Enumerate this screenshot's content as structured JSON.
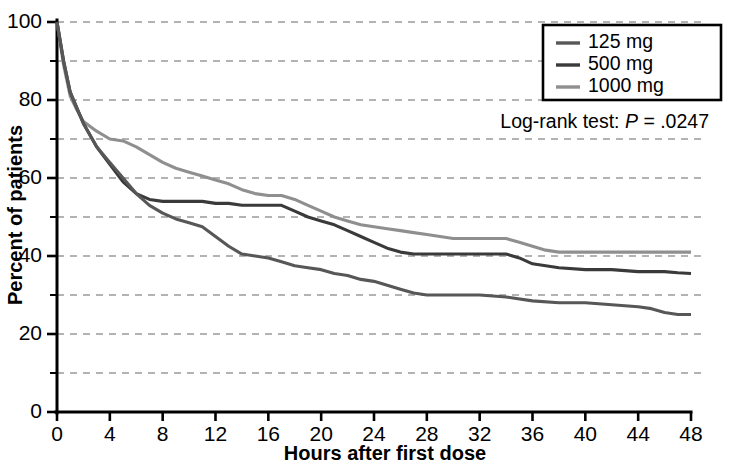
{
  "chart_data": {
    "type": "line",
    "title": "",
    "subtitle": "",
    "xlabel": "Hours after first dose",
    "ylabel": "Percent of patients",
    "xlim": [
      0,
      48
    ],
    "ylim": [
      0,
      100
    ],
    "xticks": [
      0,
      4,
      8,
      12,
      16,
      20,
      24,
      28,
      32,
      36,
      40,
      44,
      48
    ],
    "yticks": [
      0,
      20,
      40,
      60,
      80,
      100
    ],
    "yticks_minor": [
      10,
      30,
      50,
      70,
      90
    ],
    "grid": "horizontal-dashed",
    "legend_position": "top-right",
    "annotations": [
      {
        "name": "log-rank-test",
        "prefix": "Log-rank test: ",
        "statistic": "P",
        "operator": " = ",
        "value": ".0247",
        "text": "Log-rank test: P = .0247"
      }
    ],
    "series": [
      {
        "name": "125 mg",
        "label": "125 mg",
        "color": "#575757",
        "x": [
          0,
          0.5,
          1,
          1.5,
          2,
          3,
          4,
          5,
          6,
          7,
          8,
          9,
          10,
          11,
          12,
          13,
          14,
          15,
          16,
          17,
          18,
          19,
          20,
          21,
          22,
          23,
          24,
          25,
          26,
          27,
          28,
          30,
          32,
          34,
          36,
          38,
          40,
          42,
          44,
          45,
          46,
          47,
          48
        ],
        "y": [
          100,
          90,
          82,
          78,
          74,
          68,
          64,
          60,
          56,
          53,
          51,
          49.5,
          48.5,
          47.5,
          45,
          42.5,
          40.5,
          40,
          39.5,
          38.5,
          37.5,
          37,
          36.5,
          35.5,
          35,
          34,
          33.5,
          32.5,
          31.5,
          30.5,
          30,
          30,
          30,
          29.5,
          28.5,
          28,
          28,
          27.5,
          27,
          26.5,
          25.5,
          25,
          25
        ]
      },
      {
        "name": "500 mg",
        "label": "500 mg",
        "color": "#3a3a3a",
        "x": [
          0,
          0.5,
          1,
          1.5,
          2,
          3,
          4,
          5,
          6,
          7,
          8,
          9,
          10,
          11,
          12,
          13,
          14,
          15,
          16,
          17,
          18,
          19,
          20,
          21,
          22,
          23,
          24,
          25,
          26,
          27,
          28,
          29,
          30,
          32,
          34,
          35,
          36,
          38,
          40,
          42,
          44,
          46,
          47,
          48
        ],
        "y": [
          100,
          90,
          82,
          78,
          74,
          68,
          63.5,
          59,
          56,
          54.5,
          54,
          54,
          54,
          54,
          53.5,
          53.5,
          53,
          53,
          53,
          53,
          51.5,
          50,
          49,
          48,
          46.5,
          45,
          43.5,
          42,
          41,
          40.5,
          40.5,
          40.5,
          40.5,
          40.5,
          40.5,
          39.5,
          38,
          37,
          36.5,
          36.5,
          36,
          36,
          35.7,
          35.5
        ]
      },
      {
        "name": "1000 mg",
        "label": "1000 mg",
        "color": "#8f8f8f",
        "x": [
          0,
          0.5,
          1,
          1.5,
          2,
          3,
          4,
          5,
          6,
          7,
          8,
          9,
          10,
          11,
          12,
          13,
          14,
          15,
          16,
          17,
          18,
          19,
          20,
          21,
          22,
          23,
          24,
          25,
          26,
          27,
          28,
          29,
          30,
          31,
          32,
          33,
          34,
          35,
          36,
          37,
          38,
          39,
          40,
          42,
          44,
          46,
          48
        ],
        "y": [
          100,
          89,
          81,
          77.5,
          74.5,
          72,
          70,
          69.5,
          68,
          66,
          64,
          62.5,
          61.5,
          60.5,
          59.5,
          58.5,
          57,
          56,
          55.5,
          55.5,
          54.5,
          53,
          51.5,
          50,
          49,
          48,
          47.5,
          47,
          46.5,
          46,
          45.5,
          45,
          44.5,
          44.5,
          44.5,
          44.5,
          44.5,
          43.5,
          42.5,
          41.5,
          41,
          41,
          41,
          41,
          41,
          41,
          41
        ]
      }
    ]
  },
  "legend": {
    "entries": [
      {
        "label": "125 mg",
        "color": "#575757"
      },
      {
        "label": "500 mg",
        "color": "#3a3a3a"
      },
      {
        "label": "1000 mg",
        "color": "#8f8f8f"
      }
    ]
  },
  "axes": {
    "x": {
      "title": "Hours after first dose",
      "tick_labels": [
        "0",
        "4",
        "8",
        "12",
        "16",
        "20",
        "24",
        "28",
        "32",
        "36",
        "40",
        "44",
        "48"
      ]
    },
    "y": {
      "title": "Percent of patients",
      "tick_labels": [
        "0",
        "20",
        "40",
        "60",
        "80",
        "100"
      ]
    }
  },
  "colors": {
    "axis": "#000000",
    "grid": "#9a9a9a",
    "background": "#ffffff",
    "dose_125": "#575757",
    "dose_500": "#3a3a3a",
    "dose_1000": "#8f8f8f"
  }
}
